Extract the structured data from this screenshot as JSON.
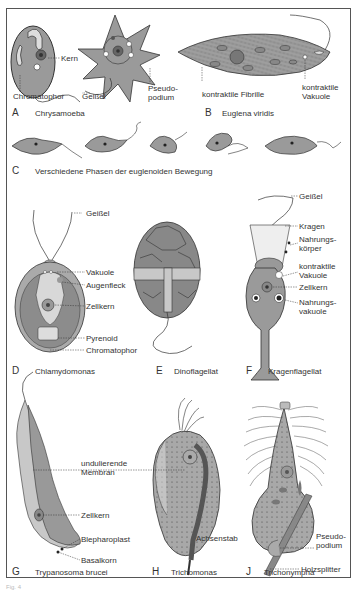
{
  "figure": {
    "note": "Fig. 4"
  },
  "panels": [
    {
      "letter": "A",
      "title": "Chrysamoeba",
      "labels": [
        "Kern",
        "Chromatophor",
        "Geißel",
        "Pseudo-\npodium"
      ]
    },
    {
      "letter": "B",
      "title": "Euglena viridis",
      "labels": [
        "kontraktile Fibrille",
        "kontraktile\nVakuole"
      ]
    },
    {
      "letter": "C",
      "title": "Verschiedene Phasen der euglenoiden Bewegung",
      "labels": []
    },
    {
      "letter": "D",
      "title": "Chlamydomonas",
      "labels": [
        "Geißel",
        "Vakuole",
        "Augenfleck",
        "Zellkern",
        "Pyrenoid",
        "Chromatophor"
      ]
    },
    {
      "letter": "E",
      "title": "Dinoflagellat",
      "labels": []
    },
    {
      "letter": "F",
      "title": "Kragenflagellat",
      "labels": [
        "Geißel",
        "Kragen",
        "Nahrungs-\nkörper",
        "kontraktile\nVakuole",
        "Zellkern",
        "Nahrungs-\nvakuole"
      ]
    },
    {
      "letter": "G",
      "title": "Trypanosoma brucei",
      "labels": [
        "undulierende\nMembran",
        "Zellkern",
        "Blepharoplast",
        "Basalkorn"
      ]
    },
    {
      "letter": "H",
      "title": "Trichomonas",
      "labels": [
        "Achsenstab"
      ]
    },
    {
      "letter": "J",
      "title": "Trichonympha",
      "labels": [
        "Pseudo-\npodium",
        "Holzsplitter"
      ]
    }
  ],
  "colors": {
    "cell_fill": "#9a9a9a",
    "cell_light": "#c8c8c8",
    "line": "#333333",
    "frame": "#555555"
  }
}
